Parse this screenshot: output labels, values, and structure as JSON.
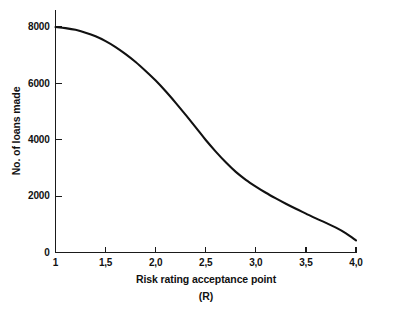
{
  "chart_data": {
    "type": "line",
    "title": "",
    "xlabel": "Risk rating acceptance point",
    "xlabel_line2": "(R)",
    "ylabel": "No. of loans made",
    "xlim": [
      1.0,
      4.0
    ],
    "ylim": [
      0,
      8000
    ],
    "grid": false,
    "legend": "none",
    "x_tick_labels": [
      "1",
      "1,5",
      "2,0",
      "2,5",
      "3,0",
      "3,5",
      "4,0"
    ],
    "x_tick_values": [
      1.0,
      1.5,
      2.0,
      2.5,
      3.0,
      3.5,
      4.0
    ],
    "y_tick_labels": [
      "0",
      "2000",
      "4000",
      "6000",
      "8000"
    ],
    "y_tick_values": [
      0,
      2000,
      4000,
      6000,
      8000
    ],
    "series": [
      {
        "name": "No. of loans made",
        "color": "#111111",
        "x": [
          1.0,
          1.1,
          1.2,
          1.3,
          1.4,
          1.5,
          1.6,
          1.7,
          1.8,
          1.9,
          2.0,
          2.1,
          2.2,
          2.3,
          2.4,
          2.5,
          2.6,
          2.7,
          2.8,
          2.9,
          3.0,
          3.1,
          3.2,
          3.3,
          3.4,
          3.5,
          3.6,
          3.7,
          3.8,
          3.9,
          4.0
        ],
        "values": [
          8000,
          7960,
          7900,
          7800,
          7670,
          7500,
          7290,
          7040,
          6760,
          6440,
          6100,
          5720,
          5310,
          4880,
          4440,
          3990,
          3580,
          3200,
          2860,
          2580,
          2340,
          2120,
          1920,
          1730,
          1550,
          1380,
          1210,
          1050,
          880,
          680,
          430
        ]
      }
    ]
  }
}
